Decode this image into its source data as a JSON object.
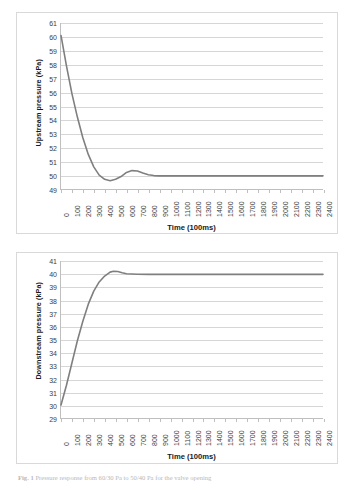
{
  "figure": {
    "caption_prefix": "Fig. 1",
    "caption_text": "Pressure response from 60/30 Pa to 50/40 Pa for the valve opening",
    "line_color": "#7f7f7f",
    "gridline_color": "#d6d6d6",
    "axis_color": "#bfbfbf"
  },
  "chart_data": [
    {
      "id": "upstream",
      "type": "line",
      "title": "",
      "xlabel": "Time (100ms)",
      "ylabel": "Upstream pressure (kPa)",
      "xlim": [
        0,
        2400
      ],
      "ylim": [
        49,
        61
      ],
      "grid": true,
      "legend": "none",
      "xticks": [
        0,
        100,
        200,
        300,
        400,
        500,
        600,
        700,
        800,
        900,
        1000,
        1100,
        1200,
        1300,
        1400,
        1500,
        1600,
        1700,
        1800,
        1900,
        2000,
        2100,
        2200,
        2300,
        2400
      ],
      "yticks": [
        49,
        50,
        51,
        52,
        53,
        54,
        55,
        56,
        57,
        58,
        59,
        60,
        61
      ],
      "series": [
        {
          "name": "Upstream pressure",
          "x": [
            0,
            50,
            100,
            150,
            200,
            250,
            300,
            350,
            400,
            450,
            500,
            550,
            600,
            650,
            700,
            750,
            800,
            850,
            900,
            1000,
            1200,
            1400,
            1600,
            1800,
            2000,
            2200,
            2400
          ],
          "y": [
            60.1,
            57.9,
            55.9,
            54.2,
            52.7,
            51.5,
            50.6,
            50.0,
            49.7,
            49.6,
            49.7,
            49.9,
            50.2,
            50.33,
            50.3,
            50.15,
            50.03,
            49.97,
            49.95,
            49.95,
            49.95,
            49.95,
            49.95,
            49.95,
            49.95,
            49.95,
            49.95
          ]
        }
      ]
    },
    {
      "id": "downstream",
      "type": "line",
      "title": "",
      "xlabel": "Time (100ms)",
      "ylabel": "Downstream pressure (kPa)",
      "xlim": [
        0,
        2400
      ],
      "ylim": [
        29,
        41
      ],
      "grid": true,
      "legend": "none",
      "xticks": [
        0,
        100,
        200,
        300,
        400,
        500,
        600,
        700,
        800,
        900,
        1000,
        1100,
        1200,
        1300,
        1400,
        1500,
        1600,
        1700,
        1800,
        1900,
        2000,
        2100,
        2200,
        2300,
        2400
      ],
      "yticks": [
        29,
        30,
        31,
        32,
        33,
        34,
        35,
        36,
        37,
        38,
        39,
        40,
        41
      ],
      "series": [
        {
          "name": "Downstream pressure",
          "x": [
            0,
            50,
            100,
            150,
            200,
            250,
            300,
            350,
            400,
            450,
            480,
            520,
            560,
            600,
            700,
            800,
            900,
            1000,
            1200,
            1400,
            1600,
            1800,
            2000,
            2200,
            2400
          ],
          "y": [
            30.0,
            31.5,
            33.2,
            34.9,
            36.4,
            37.7,
            38.7,
            39.4,
            39.85,
            40.15,
            40.22,
            40.2,
            40.1,
            40.02,
            39.99,
            39.98,
            39.98,
            39.98,
            39.98,
            39.98,
            39.98,
            39.98,
            39.98,
            39.98,
            39.98
          ]
        }
      ]
    }
  ]
}
